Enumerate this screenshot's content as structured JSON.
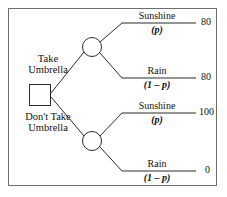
{
  "diagram": {
    "type": "decision-tree",
    "border_color": "#6e6e6e",
    "line_color": "#2b2b2b",
    "decision_node": {
      "shape": "square",
      "choices": [
        {
          "label_line1": "Take",
          "label_line2": "Umbrella"
        },
        {
          "label_line1": "Don't Take",
          "label_line2": "Umbrella"
        }
      ]
    },
    "chance_nodes": [
      {
        "shape": "circle",
        "branches": [
          {
            "state": "Sunshine",
            "probability": "(p)",
            "payoff": "80"
          },
          {
            "state": "Rain",
            "probability": "(1 – p)",
            "payoff": "80"
          }
        ]
      },
      {
        "shape": "circle",
        "branches": [
          {
            "state": "Sunshine",
            "probability": "(p)",
            "payoff": "100"
          },
          {
            "state": "Rain",
            "probability": "(1 – p)",
            "payoff": "0"
          }
        ]
      }
    ]
  }
}
